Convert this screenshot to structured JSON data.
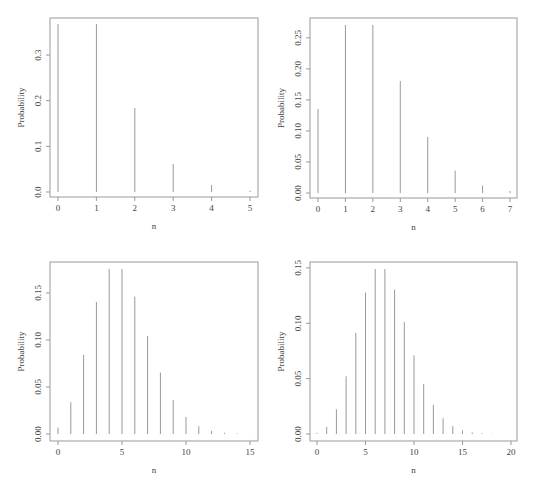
{
  "chart_data": [
    {
      "type": "bar",
      "subtype": "stem",
      "title": "",
      "xlabel": "n",
      "ylabel": "Probability",
      "x": [
        0,
        1,
        2,
        3,
        4,
        5
      ],
      "values": [
        0.3679,
        0.3679,
        0.1839,
        0.0613,
        0.0153,
        0.0031
      ],
      "xticks": [
        "0",
        "1",
        "2",
        "3",
        "4",
        "5"
      ],
      "yticks": [
        "0.0",
        "0.1",
        "0.2",
        "0.3"
      ],
      "ytick_values": [
        0,
        0.1,
        0.2,
        0.3
      ],
      "xlim": [
        0,
        5
      ],
      "ylim": [
        0,
        0.3679
      ],
      "grid": false,
      "layout": {
        "left": 50,
        "top": 18,
        "right": 258,
        "bottom": 197,
        "x0px": 58,
        "x1px": 250,
        "y0px": 192,
        "ymaxpx": 24
      }
    },
    {
      "type": "bar",
      "subtype": "stem",
      "title": "",
      "xlabel": "n",
      "ylabel": "Probability",
      "x": [
        0,
        1,
        2,
        3,
        4,
        5,
        6,
        7
      ],
      "values": [
        0.1353,
        0.2707,
        0.2707,
        0.1804,
        0.0902,
        0.0361,
        0.012,
        0.0034
      ],
      "xticks": [
        "0",
        "1",
        "2",
        "3",
        "4",
        "5",
        "6",
        "7"
      ],
      "yticks": [
        "0.00",
        "0.05",
        "0.10",
        "0.15",
        "0.20",
        "0.25"
      ],
      "ytick_values": [
        0,
        0.05,
        0.1,
        0.15,
        0.2,
        0.25
      ],
      "xlim": [
        0,
        7
      ],
      "ylim": [
        0,
        0.2707
      ],
      "grid": false,
      "layout": {
        "left": 310,
        "top": 18,
        "right": 517,
        "bottom": 198,
        "x0px": 318,
        "x1px": 510,
        "y0px": 193,
        "ymaxpx": 25
      }
    },
    {
      "type": "bar",
      "subtype": "stem",
      "title": "",
      "xlabel": "n",
      "ylabel": "Probability",
      "x": [
        0,
        1,
        2,
        3,
        4,
        5,
        6,
        7,
        8,
        9,
        10,
        11,
        12,
        13,
        14,
        15
      ],
      "values": [
        0.0067,
        0.0337,
        0.0842,
        0.1404,
        0.1755,
        0.1755,
        0.1462,
        0.1044,
        0.0653,
        0.0363,
        0.0181,
        0.0082,
        0.0034,
        0.0013,
        0.0005,
        0.0002
      ],
      "xticks": [
        "0",
        "5",
        "10",
        "15"
      ],
      "xtick_values": [
        0,
        5,
        10,
        15
      ],
      "yticks": [
        "0.00",
        "0.05",
        "0.10",
        "0.15"
      ],
      "ytick_values": [
        0,
        0.05,
        0.1,
        0.15
      ],
      "xlim": [
        0,
        15
      ],
      "ylim": [
        0,
        0.1755
      ],
      "grid": false,
      "layout": {
        "left": 50,
        "top": 262,
        "right": 258,
        "bottom": 441,
        "x0px": 58,
        "x1px": 250,
        "y0px": 434,
        "ymaxpx": 269
      }
    },
    {
      "type": "bar",
      "subtype": "stem",
      "title": "",
      "xlabel": "n",
      "ylabel": "Probability",
      "x": [
        0,
        1,
        2,
        3,
        4,
        5,
        6,
        7,
        8,
        9,
        10,
        11,
        12,
        13,
        14,
        15,
        16,
        17,
        18,
        19,
        20
      ],
      "values": [
        0.0009,
        0.0064,
        0.0223,
        0.0521,
        0.0912,
        0.1277,
        0.149,
        0.149,
        0.1304,
        0.1014,
        0.071,
        0.0452,
        0.0263,
        0.0142,
        0.0071,
        0.0033,
        0.0014,
        0.0006,
        0.0002,
        0.0001,
        0.0
      ],
      "xticks": [
        "0",
        "5",
        "10",
        "15",
        "20"
      ],
      "xtick_values": [
        0,
        5,
        10,
        15,
        20
      ],
      "yticks": [
        "0.00",
        "0.05",
        "0.10",
        "0.15"
      ],
      "ytick_values": [
        0,
        0.05,
        0.1,
        0.15
      ],
      "xlim": [
        0,
        20
      ],
      "ylim": [
        0,
        0.149
      ],
      "grid": false,
      "layout": {
        "left": 310,
        "top": 262,
        "right": 517,
        "bottom": 441,
        "x0px": 317,
        "x1px": 511,
        "y0px": 434,
        "ymaxpx": 269
      }
    }
  ]
}
